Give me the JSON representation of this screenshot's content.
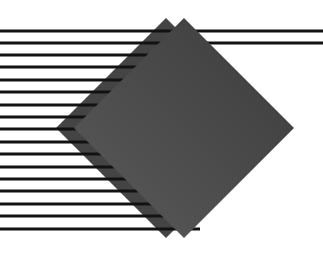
{
  "image": {
    "width": 323,
    "height": 260,
    "background": "#ffffff",
    "description": "Abstract geometric graphic: horizontal black stripes with two overlapping dark gray diamonds"
  },
  "colors": {
    "line": "#121212",
    "back_diamond": "#444444",
    "front_diamond_top": "#3c3c3c",
    "front_diamond_bottom": "#5a5a5a"
  },
  "back_diamond": {
    "cx": 166,
    "cy": 128,
    "half_diagonal": 110
  },
  "front_diamond": {
    "cx": 184,
    "cy": 128,
    "half_diagonal": 110
  },
  "stripes": {
    "thickness": 3,
    "x_start": 0,
    "rows": [
      {
        "y": 31,
        "x_end": 323
      },
      {
        "y": 43,
        "x_end": 323
      },
      {
        "y": 55,
        "x_end": 200
      },
      {
        "y": 67,
        "x_end": 200
      },
      {
        "y": 80,
        "x_end": 200
      },
      {
        "y": 92,
        "x_end": 200
      },
      {
        "y": 105,
        "x_end": 200
      },
      {
        "y": 117,
        "x_end": 200
      },
      {
        "y": 129,
        "x_end": 200
      },
      {
        "y": 142,
        "x_end": 200
      },
      {
        "y": 154,
        "x_end": 200
      },
      {
        "y": 167,
        "x_end": 200
      },
      {
        "y": 179,
        "x_end": 200
      },
      {
        "y": 191,
        "x_end": 200
      },
      {
        "y": 204,
        "x_end": 200
      },
      {
        "y": 216,
        "x_end": 200
      },
      {
        "y": 229,
        "x_end": 200
      }
    ]
  }
}
